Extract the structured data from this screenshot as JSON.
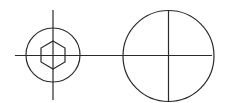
{
  "diagram": {
    "title": "",
    "line_color": "#2a2a2a",
    "background_color": "#ffffff",
    "elements": [
      {
        "name": "small-circle",
        "type": "circle"
      },
      {
        "name": "hex-socket",
        "type": "hexagon"
      },
      {
        "name": "large-circle",
        "type": "circle"
      },
      {
        "name": "horizontal-centerline",
        "type": "line"
      },
      {
        "name": "left-vertical-centerline",
        "type": "line"
      },
      {
        "name": "right-vertical-centerline",
        "type": "line"
      }
    ]
  }
}
